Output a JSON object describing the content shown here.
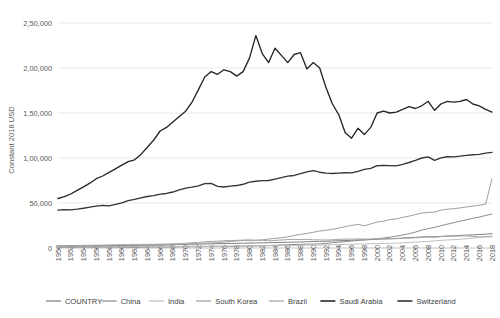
{
  "chart_data": {
    "type": "line",
    "title": "",
    "xlabel": "",
    "ylabel": "Constant 2018 USD",
    "ylim": [
      0,
      250000
    ],
    "yticks": [
      0,
      50000,
      100000,
      150000,
      200000,
      250000
    ],
    "ytick_labels": [
      "0",
      "50,000",
      "1,00,000",
      "1,50,000",
      "2,00,000",
      "2,50,000"
    ],
    "grid": true,
    "legend_position": "bottom",
    "x_start": 1950,
    "x_end": 2018,
    "x_step": 1,
    "xtick_step": 2,
    "x": [
      1950,
      1951,
      1952,
      1953,
      1954,
      1955,
      1956,
      1957,
      1958,
      1959,
      1960,
      1961,
      1962,
      1963,
      1964,
      1965,
      1966,
      1967,
      1968,
      1969,
      1970,
      1971,
      1972,
      1973,
      1974,
      1975,
      1976,
      1977,
      1978,
      1979,
      1980,
      1981,
      1982,
      1983,
      1984,
      1985,
      1986,
      1987,
      1988,
      1989,
      1990,
      1991,
      1992,
      1993,
      1994,
      1995,
      1996,
      1997,
      1998,
      1999,
      2000,
      2001,
      2002,
      2003,
      2004,
      2005,
      2006,
      2007,
      2008,
      2009,
      2010,
      2011,
      2012,
      2013,
      2014,
      2015,
      2016,
      2017,
      2018
    ],
    "xtick_labels": [
      "1950",
      "1952",
      "1954",
      "1956",
      "1958",
      "1960",
      "1962",
      "1964",
      "1966",
      "1968",
      "1970",
      "1972",
      "1974",
      "1976",
      "1978",
      "1980",
      "1982",
      "1984",
      "1986",
      "1988",
      "1990",
      "1992",
      "1994",
      "1996",
      "1998",
      "2000",
      "2002",
      "2004",
      "2006",
      "2008",
      "2010",
      "2012",
      "2014",
      "2016",
      "2018"
    ],
    "series": [
      {
        "name": "COUNTRY",
        "color": "#7f7f7f",
        "width": 1.0,
        "values": [
          2100,
          2150,
          2200,
          2260,
          2320,
          2400,
          2480,
          2550,
          2620,
          2700,
          2800,
          2900,
          3000,
          3120,
          3250,
          3380,
          3500,
          3620,
          3750,
          3900,
          4050,
          4200,
          4350,
          4500,
          4620,
          4750,
          4900,
          5050,
          5200,
          5350,
          5500,
          5620,
          5750,
          5900,
          6050,
          6200,
          6380,
          6550,
          6750,
          6950,
          7150,
          7350,
          7550,
          7800,
          8050,
          8300,
          8600,
          8900,
          9150,
          9400,
          9750,
          10000,
          10250,
          10600,
          11000,
          11400,
          11850,
          12300,
          12550,
          12450,
          12900,
          13300,
          13600,
          13950,
          14300,
          14600,
          14950,
          15400,
          15800
        ]
      },
      {
        "name": "China",
        "color": "#8c8c8c",
        "width": 1.0,
        "values": [
          800,
          820,
          880,
          920,
          950,
          1000,
          1050,
          1080,
          1150,
          1080,
          1000,
          880,
          900,
          980,
          1080,
          1150,
          1220,
          1150,
          1200,
          1300,
          1420,
          1480,
          1500,
          1600,
          1620,
          1700,
          1680,
          1780,
          1950,
          2080,
          2200,
          2300,
          2480,
          2700,
          3050,
          3380,
          3580,
          3850,
          4150,
          4250,
          4300,
          4620,
          5200,
          5800,
          6450,
          7100,
          7750,
          8400,
          8950,
          9550,
          10300,
          11100,
          12050,
          13150,
          14450,
          15900,
          17700,
          19800,
          21500,
          22900,
          24700,
          26500,
          28100,
          29800,
          31400,
          32900,
          34400,
          36100,
          37800
        ]
      },
      {
        "name": "India",
        "color": "#bfbfbf",
        "width": 1.0,
        "values": [
          1300,
          1320,
          1350,
          1400,
          1430,
          1470,
          1520,
          1500,
          1580,
          1600,
          1660,
          1680,
          1690,
          1730,
          1800,
          1760,
          1740,
          1800,
          1840,
          1920,
          1980,
          1960,
          1930,
          1970,
          1950,
          2050,
          2050,
          2170,
          2280,
          2180,
          2290,
          2380,
          2430,
          2540,
          2600,
          2670,
          2760,
          2800,
          2990,
          3130,
          3280,
          3300,
          3420,
          3550,
          3740,
          3950,
          4180,
          4290,
          4480,
          4730,
          4900,
          5080,
          5140,
          5420,
          5750,
          6140,
          6580,
          7070,
          7330,
          7880,
          8480,
          8920,
          9280,
          9720,
          10280,
          10960,
          11740,
          12420,
          13050
        ]
      },
      {
        "name": "South Korea",
        "color": "#9e9e9e",
        "width": 1.0,
        "values": [
          1500,
          1450,
          1600,
          1750,
          1850,
          1920,
          1950,
          2060,
          2150,
          2200,
          2250,
          2320,
          2380,
          2560,
          2700,
          2830,
          3100,
          3300,
          3620,
          4000,
          4300,
          4600,
          4850,
          5420,
          5700,
          6000,
          6650,
          7240,
          7890,
          8350,
          8050,
          8550,
          9000,
          9900,
          10700,
          11300,
          12500,
          13800,
          15200,
          16100,
          17500,
          18800,
          19700,
          20700,
          22200,
          23800,
          25100,
          26200,
          24700,
          26800,
          28800,
          29700,
          31600,
          32300,
          34000,
          35400,
          37100,
          38800,
          39600,
          39800,
          42000,
          43100,
          43700,
          44500,
          45600,
          46500,
          47500,
          48600,
          77000
        ]
      },
      {
        "name": "Brazil",
        "color": "#a6a6a6",
        "width": 1.0,
        "values": [
          2600,
          2700,
          2760,
          2800,
          2950,
          3050,
          3080,
          3250,
          3420,
          3580,
          3750,
          3900,
          4000,
          3980,
          4050,
          4080,
          4280,
          4350,
          4650,
          4960,
          5300,
          5800,
          6300,
          6950,
          7350,
          7600,
          8050,
          8250,
          8450,
          8850,
          9100,
          8600,
          8500,
          8050,
          8400,
          8850,
          9400,
          9600,
          9400,
          9600,
          9100,
          9050,
          8850,
          9150,
          9600,
          9800,
          9900,
          10100,
          10000,
          9950,
          10250,
          10200,
          10300,
          10350,
          10800,
          11000,
          11300,
          11800,
          12150,
          11900,
          12700,
          13000,
          13150,
          13400,
          13400,
          12850,
          12350,
          12450,
          12500
        ]
      },
      {
        "name": "Saudi Arabia",
        "color": "#262626",
        "width": 1.35,
        "values": [
          55000,
          57000,
          60000,
          64000,
          68000,
          72000,
          77000,
          80000,
          84000,
          88000,
          92000,
          96000,
          98000,
          104000,
          112000,
          120000,
          130000,
          134000,
          140000,
          146000,
          152000,
          162000,
          176000,
          190000,
          196000,
          193000,
          198000,
          196000,
          191000,
          196000,
          211000,
          236000,
          216000,
          206000,
          222000,
          214000,
          206000,
          215000,
          217000,
          199000,
          206000,
          200000,
          178000,
          160000,
          148000,
          128000,
          122000,
          133000,
          126000,
          134000,
          150000,
          152000,
          150000,
          151000,
          154000,
          157000,
          155000,
          158000,
          163000,
          153000,
          160000,
          163000,
          162000,
          163000,
          165000,
          160000,
          158000,
          154000,
          151000
        ]
      },
      {
        "name": "Switzerland",
        "color": "#333333",
        "width": 1.35,
        "values": [
          42000,
          42600,
          42400,
          43200,
          44200,
          45400,
          46600,
          47400,
          46800,
          48400,
          50200,
          52600,
          54000,
          55600,
          57200,
          58200,
          59800,
          60600,
          62200,
          64600,
          66600,
          67600,
          69000,
          71600,
          71800,
          68400,
          67800,
          68800,
          69400,
          70800,
          73200,
          74200,
          74800,
          75000,
          76600,
          78200,
          79800,
          80600,
          82600,
          84600,
          86000,
          84200,
          83200,
          82800,
          83200,
          83600,
          83400,
          85200,
          87400,
          88400,
          91400,
          91800,
          91600,
          91200,
          93000,
          95000,
          97400,
          100000,
          101200,
          97400,
          100200,
          101400,
          101200,
          102000,
          103000,
          103600,
          104000,
          105400,
          106200
        ]
      }
    ]
  },
  "legend": {
    "items": [
      {
        "label": "COUNTRY"
      },
      {
        "label": "China"
      },
      {
        "label": "India"
      },
      {
        "label": "South Korea"
      },
      {
        "label": "Brazil"
      },
      {
        "label": "Saudi Arabia"
      },
      {
        "label": "Switzerland"
      }
    ]
  }
}
